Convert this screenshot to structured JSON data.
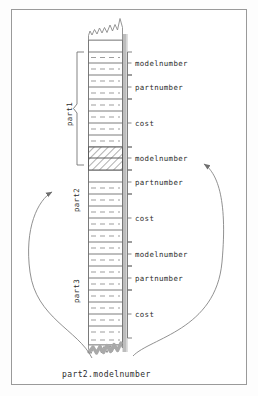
{
  "diagram": {
    "caption": "part2.modelnumber",
    "colors": {
      "frame": "#9a9a9a",
      "cell_border": "#6d6d6d",
      "dash": "#8d8d8d",
      "shadow_bar": "#b9b9b9",
      "hatch": "#7a7a7a",
      "text": "#2c2c2c",
      "arrow": "#7d7d7d"
    },
    "group_labels": [
      {
        "name": "part1",
        "text": "part1",
        "has_brace": true,
        "has_arrow": false
      },
      {
        "name": "part2",
        "text": "part2",
        "has_brace": false,
        "has_arrow": true
      },
      {
        "name": "part3",
        "text": "part3",
        "has_brace": false,
        "has_arrow": false
      }
    ],
    "field_labels": [
      {
        "index": 0,
        "text": "modelnumber",
        "record": "part1",
        "highlighted": false,
        "pointed_by_arrow": false
      },
      {
        "index": 1,
        "text": "partnumber",
        "record": "part1",
        "highlighted": false,
        "pointed_by_arrow": false
      },
      {
        "index": 2,
        "text": "cost",
        "record": "part1",
        "highlighted": false,
        "pointed_by_arrow": false
      },
      {
        "index": 3,
        "text": "modelnumber",
        "record": "part2",
        "highlighted": true,
        "pointed_by_arrow": true
      },
      {
        "index": 4,
        "text": "partnumber",
        "record": "part2",
        "highlighted": false,
        "pointed_by_arrow": false
      },
      {
        "index": 5,
        "text": "cost",
        "record": "part2",
        "highlighted": false,
        "pointed_by_arrow": false
      },
      {
        "index": 6,
        "text": "modelnumber",
        "record": "part3",
        "highlighted": false,
        "pointed_by_arrow": false
      },
      {
        "index": 7,
        "text": "partnumber",
        "record": "part3",
        "highlighted": false,
        "pointed_by_arrow": false
      },
      {
        "index": 8,
        "text": "cost",
        "record": "part3",
        "highlighted": false,
        "pointed_by_arrow": false
      }
    ],
    "memory_column": {
      "top_edge": "torn",
      "bottom_edge": "torn",
      "has_right_shadow_bar": true,
      "highlighted_block": "modelnumber of part2"
    }
  }
}
